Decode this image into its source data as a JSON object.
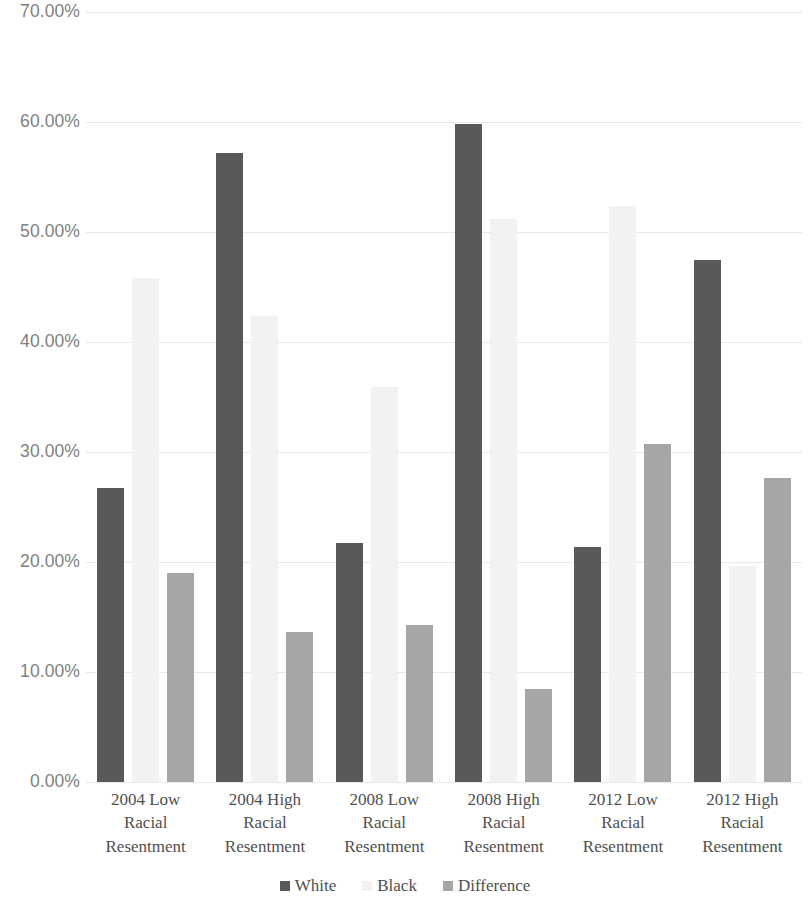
{
  "chart_data": {
    "type": "bar",
    "title": "",
    "subtitle": "",
    "xlabel": "",
    "ylabel": "",
    "ylim": [
      0,
      70
    ],
    "y_ticks": [
      "0.00%",
      "10.00%",
      "20.00%",
      "30.00%",
      "40.00%",
      "50.00%",
      "60.00%",
      "70.00%"
    ],
    "y_tick_values": [
      0,
      10,
      20,
      30,
      40,
      50,
      60,
      70
    ],
    "grid": true,
    "legend_position": "bottom",
    "categories": [
      "2004 Low Racial Resentment",
      "2004 High Racial Resentment",
      "2008 Low Racial Resentment",
      "2008 High Racial Resentment",
      "2012 Low Racial Resentment",
      "2012 High Racial Resentment"
    ],
    "category_lines": [
      [
        "2004 Low",
        "Racial",
        "Resentment"
      ],
      [
        "2004 High",
        "Racial",
        "Resentment"
      ],
      [
        "2008 Low",
        "Racial",
        "Resentment"
      ],
      [
        "2008 High",
        "Racial",
        "Resentment"
      ],
      [
        "2012 Low",
        "Racial",
        "Resentment"
      ],
      [
        "2012 High",
        "Racial",
        "Resentment"
      ]
    ],
    "series": [
      {
        "name": "White",
        "color": "#595959",
        "values": [
          26.7,
          57.2,
          21.7,
          59.8,
          21.4,
          47.5
        ]
      },
      {
        "name": "Black",
        "color": "#f2f2f2",
        "values": [
          45.8,
          42.4,
          35.9,
          51.2,
          52.4,
          19.6
        ]
      },
      {
        "name": "Difference",
        "color": "#a6a6a6",
        "values": [
          19.0,
          13.6,
          14.3,
          8.5,
          30.7,
          27.6
        ]
      }
    ]
  },
  "legend": {
    "items": [
      {
        "label": "White",
        "color": "#595959"
      },
      {
        "label": "Black",
        "color": "#f2f2f2"
      },
      {
        "label": "Difference",
        "color": "#a6a6a6"
      }
    ]
  }
}
